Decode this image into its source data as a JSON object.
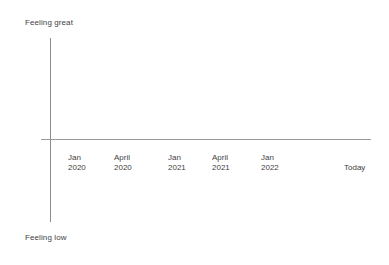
{
  "chart_data": {
    "type": "line",
    "title": "",
    "subtitle": "",
    "xlabel": "",
    "ylabel": "",
    "grid": false,
    "legend": false,
    "series": [
      {
        "name": "mood",
        "x": [],
        "values": []
      }
    ],
    "x_axis": {
      "tick_labels": [
        "Jan 2020",
        "April 2020",
        "Jan 2021",
        "April 2021",
        "Jan 2022",
        "Today"
      ]
    },
    "y_axis": {
      "top_label": "Feeling great",
      "bottom_label": "Feeling low",
      "tick_labels": []
    },
    "annotations": [],
    "note": "Empty mood timeline: axes drawn with no plotted data points"
  },
  "axis": {
    "y_top_label": "Feeling great",
    "y_bottom_label": "Feeling low",
    "line_color": "#8c8c8c",
    "text_color": "#3f3f3f"
  },
  "ticks": [
    {
      "line1": "Jan",
      "line2": "2020",
      "x": 68,
      "terminal": false
    },
    {
      "line1": "April",
      "line2": "2020",
      "x": 114,
      "terminal": false
    },
    {
      "line1": "Jan",
      "line2": "2021",
      "x": 168,
      "terminal": false
    },
    {
      "line1": "April",
      "line2": "2021",
      "x": 212,
      "terminal": false
    },
    {
      "line1": "Jan",
      "line2": "2022",
      "x": 261,
      "terminal": false
    },
    {
      "line1": "Today",
      "line2": "",
      "x": 344,
      "terminal": true
    }
  ]
}
